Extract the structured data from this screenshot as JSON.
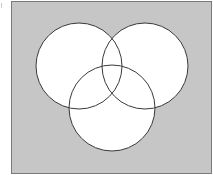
{
  "diagram": {
    "type": "venn",
    "sets": 3,
    "colors": {
      "universe_fill": "#c6c6c6",
      "universe_stroke": "#7a7a7a",
      "circle_fill": "#ffffff",
      "circle_stroke": "#3a3a3a"
    },
    "universe": {
      "x": 11.5,
      "y": 1.5,
      "width": 200,
      "height": 172
    },
    "circles": [
      {
        "name": "left",
        "cx": 79,
        "cy": 66,
        "r": 43
      },
      {
        "name": "right",
        "cx": 145,
        "cy": 66,
        "r": 43
      },
      {
        "name": "bottom",
        "cx": 112,
        "cy": 108,
        "r": 43
      }
    ]
  }
}
